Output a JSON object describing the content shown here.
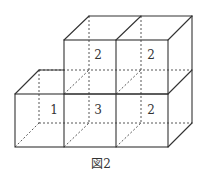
{
  "figure": {
    "caption": "図2",
    "labels": {
      "top_middle": "2",
      "top_right": "2",
      "bottom_left": "1",
      "bottom_middle": "3",
      "bottom_right": "2"
    },
    "colors": {
      "line": "#333333",
      "background": "#ffffff"
    }
  }
}
